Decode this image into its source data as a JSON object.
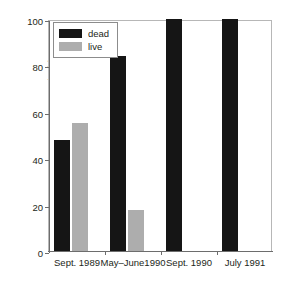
{
  "chart_data": {
    "type": "bar",
    "title": "",
    "subtitle": "",
    "xlabel": "",
    "ylabel": "Percent unionids",
    "categories": [
      "Sept. 1989",
      "May–June1990",
      "Sept. 1990",
      "July 1991"
    ],
    "series": [
      {
        "name": "dead",
        "color": "#151515",
        "values": [
          48,
          84,
          100,
          100
        ]
      },
      {
        "name": "live",
        "color": "#adadad",
        "values": [
          55,
          17.5,
          0,
          0
        ]
      }
    ],
    "ylim": [
      0,
      100
    ],
    "yticks": [
      0,
      20,
      40,
      60,
      80,
      100
    ],
    "ytick_labels": [
      "0",
      "20",
      "40",
      "60",
      "80",
      "100"
    ],
    "grid": false,
    "legend_position": "top-left",
    "legend_entries": [
      "dead",
      "live"
    ]
  },
  "axes": {
    "y_title": "Percent unionids"
  },
  "bleed_caption": "Figure caption text cropped at the bottom edge of the page"
}
